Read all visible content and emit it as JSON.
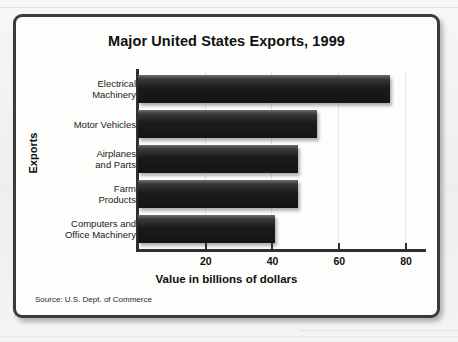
{
  "chart_data": {
    "type": "bar",
    "orientation": "horizontal",
    "title": "Major United States Exports, 1999",
    "xlabel": "Value in billions of dollars",
    "ylabel": "Exports",
    "categories": [
      "Electrical Machinery",
      "Motor Vehicles",
      "Airplanes and Parts",
      "Farm Products",
      "Computers and Office Machinery"
    ],
    "category_lines": [
      [
        "Electrical",
        "Machinery"
      ],
      [
        "Motor Vehicles"
      ],
      [
        "Airplanes",
        "and Parts"
      ],
      [
        "Farm",
        "Products"
      ],
      [
        "Computers and",
        "Office Machinery"
      ]
    ],
    "values": [
      75.5,
      53.5,
      48,
      48,
      41
    ],
    "xlim": [
      0,
      86
    ],
    "xticks": [
      20,
      40,
      60,
      80
    ],
    "xtick_labels": [
      "20",
      "40",
      "60",
      "80"
    ],
    "grid": true,
    "legend": false,
    "bar_color": "#1b1b1b",
    "source": "Source: U.S. Dept. of Commerce"
  },
  "frame": {
    "border_color": "#3a3a3a",
    "background": "#fdfdfc"
  }
}
